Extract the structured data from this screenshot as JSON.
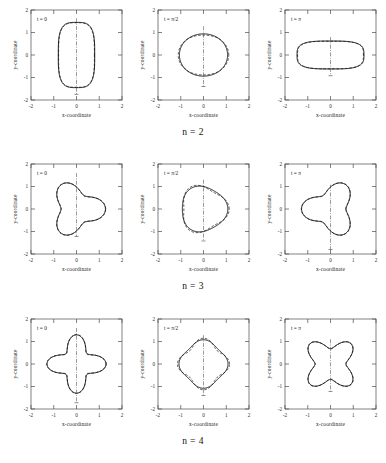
{
  "chart_data": {
    "type": "line",
    "title": "",
    "layout": {
      "rows": 3,
      "cols": 3
    },
    "xlabel": "x-coordinate",
    "ylabel": "y-coordinate",
    "xlim": [
      -2,
      2
    ],
    "ylim": [
      -2,
      2
    ],
    "xticks": [
      "-2",
      "-1",
      "0",
      "1",
      "2"
    ],
    "yticks": [
      "-2",
      "-1",
      "0",
      "1",
      "2"
    ],
    "grid": false,
    "legend": "none",
    "row_labels": [
      "n = 2",
      "n = 3",
      "n = 4"
    ],
    "column_time_labels": [
      "t = 0",
      "t = π/2",
      "t = π"
    ],
    "series_styles": [
      "solid",
      "dashed"
    ],
    "annotations": [
      "vertical dash-dot symmetry axis through x = 0 in every panel"
    ],
    "panels": [
      {
        "row": 0,
        "col": 0,
        "mode": 2,
        "time": "0",
        "time_value": 0,
        "time_label": "t = 0",
        "shape": "vertically elongated stadium / prolate",
        "r_mean": 1.0,
        "amplitude": 0.33,
        "max_y": 1.45,
        "min_y": -1.45,
        "max_x": 0.8,
        "min_x": -0.8
      },
      {
        "row": 0,
        "col": 1,
        "mode": 2,
        "time": "π/2",
        "time_value": 1.5708,
        "time_label": "t = π/2",
        "shape": "near-circular",
        "r_mean": 1.0,
        "amplitude": 0.06,
        "max_y": 1.1,
        "min_y": -1.1,
        "max_x": 0.97,
        "min_x": -0.97
      },
      {
        "row": 0,
        "col": 2,
        "mode": 2,
        "time": "π",
        "time_value": 3.1416,
        "time_label": "t = π",
        "shape": "horizontally elongated stadium / oblate",
        "r_mean": 1.0,
        "amplitude": -0.33,
        "max_y": 0.62,
        "min_y": -0.62,
        "max_x": 1.47,
        "min_x": -1.47
      },
      {
        "row": 1,
        "col": 0,
        "mode": 3,
        "time": "0",
        "time_value": 0,
        "time_label": "t = 0",
        "shape": "three-lobed, apex up",
        "r_mean": 1.0,
        "amplitude": 0.3,
        "max_y": 1.42,
        "min_y": -0.92,
        "max_x": 1.05,
        "min_x": -1.05
      },
      {
        "row": 1,
        "col": 1,
        "mode": 3,
        "time": "π/2",
        "time_value": 1.5708,
        "time_label": "t = π/2",
        "shape": "near-circular",
        "r_mean": 1.0,
        "amplitude": 0.07,
        "max_y": 1.12,
        "min_y": -1.12,
        "max_x": 0.95,
        "min_x": -0.95
      },
      {
        "row": 1,
        "col": 2,
        "mode": 3,
        "time": "π",
        "time_value": 3.1416,
        "time_label": "t = π",
        "shape": "three-lobed inverted, apex down",
        "r_mean": 1.0,
        "amplitude": -0.3,
        "max_y": 0.9,
        "min_y": -1.5,
        "max_x": 1.05,
        "min_x": -1.05
      },
      {
        "row": 2,
        "col": 0,
        "mode": 4,
        "time": "0",
        "time_value": 0,
        "time_label": "t = 0",
        "shape": "four-lobed, lobes on axes",
        "r_mean": 1.0,
        "amplitude": 0.33,
        "max_y": 1.42,
        "min_y": -1.42,
        "max_x": 1.18,
        "min_x": -1.18
      },
      {
        "row": 2,
        "col": 1,
        "mode": 4,
        "time": "π/2",
        "time_value": 1.5708,
        "time_label": "t = π/2",
        "shape": "near-circular with dashed cusps top and bottom",
        "r_mean": 1.0,
        "amplitude": 0.08,
        "max_y": 1.1,
        "min_y": -1.1,
        "max_x": 0.98,
        "min_x": -0.98
      },
      {
        "row": 2,
        "col": 2,
        "mode": 4,
        "time": "π",
        "time_value": 3.1416,
        "time_label": "t = π",
        "shape": "four-lobed rotated 45 degrees, butterfly",
        "r_mean": 1.0,
        "amplitude": -0.3,
        "max_y": 0.92,
        "min_y": -0.92,
        "max_x": 0.92,
        "min_x": -0.92
      }
    ]
  },
  "figure": {
    "axis_label_x": "x-coordinate",
    "axis_label_y": "y-coordinate",
    "rows": [
      {
        "label": "n = 2",
        "panels": [
          {
            "time_label": "t = 0"
          },
          {
            "time_label": "t = π/2"
          },
          {
            "time_label": "t = π"
          }
        ]
      },
      {
        "label": "n = 3",
        "panels": [
          {
            "time_label": "t = 0"
          },
          {
            "time_label": "t = π/2"
          },
          {
            "time_label": "t = π"
          }
        ]
      },
      {
        "label": "n = 4",
        "panels": [
          {
            "time_label": "t = 0"
          },
          {
            "time_label": "t = π/2"
          },
          {
            "time_label": "t = π"
          }
        ]
      }
    ]
  }
}
